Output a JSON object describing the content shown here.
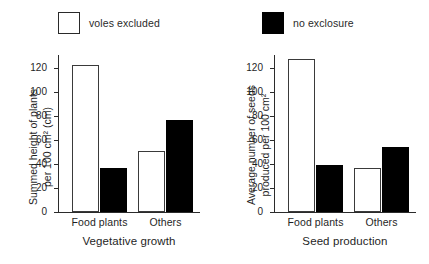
{
  "legend": {
    "entries": [
      {
        "label": "voles excluded",
        "swatch": "open-square",
        "color": "#ffffff"
      },
      {
        "label": "no exclosure",
        "swatch": "filled-square",
        "color": "#000000"
      }
    ]
  },
  "caption_remnant": "",
  "chart_data": [
    {
      "type": "bar",
      "title": "Vegetative growth",
      "xlabel": "Vegetative growth",
      "ylabel": "Summed height of plants\nper 100 cm² (cm)",
      "categories": [
        "Food plants",
        "Others"
      ],
      "ylim": [
        0,
        132
      ],
      "yticks": [
        0,
        20,
        40,
        60,
        80,
        100,
        120
      ],
      "ytick_labels": [
        "0",
        "20",
        "40",
        "60",
        "80",
        "100",
        "120"
      ],
      "grid": false,
      "legend_position": "above-figure",
      "series": [
        {
          "name": "voles excluded",
          "color": "#ffffff",
          "values": [
            123,
            51
          ]
        },
        {
          "name": "no exclosure",
          "color": "#000000",
          "values": [
            37,
            77
          ]
        }
      ]
    },
    {
      "type": "bar",
      "title": "Seed production",
      "xlabel": "Seed production",
      "ylabel": "Average number of seeds\nproduced per 100 cm²",
      "categories": [
        "Food plants",
        "Others"
      ],
      "ylim": [
        0,
        132
      ],
      "yticks": [
        0,
        20,
        40,
        60,
        80,
        100,
        120
      ],
      "ytick_labels": [
        "0",
        "20",
        "40",
        "60",
        "80",
        "100",
        "120"
      ],
      "grid": false,
      "legend_position": "above-figure",
      "series": [
        {
          "name": "voles excluded",
          "color": "#ffffff",
          "values": [
            128,
            37
          ]
        },
        {
          "name": "no exclosure",
          "color": "#000000",
          "values": [
            39,
            54
          ]
        }
      ]
    }
  ]
}
